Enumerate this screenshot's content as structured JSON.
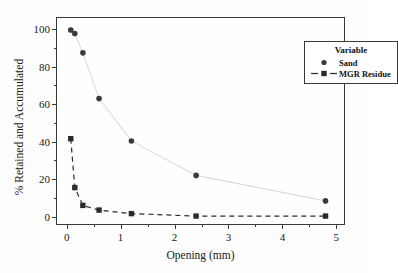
{
  "chart_data": {
    "type": "scatter",
    "title": "",
    "xlabel": "Opening (mm)",
    "ylabel": "% Retained and Accumulated",
    "xlim": [
      -0.18,
      5.18
    ],
    "ylim": [
      -5,
      106
    ],
    "xticks": [
      0,
      1,
      2,
      3,
      4,
      5
    ],
    "xtick_labels": [
      "0",
      "1",
      "2",
      "3",
      "4",
      "5"
    ],
    "yticks": [
      0,
      20,
      40,
      60,
      80,
      100
    ],
    "ytick_labels": [
      "0",
      "20",
      "40",
      "60",
      "80",
      "100"
    ],
    "grid": false,
    "legend": {
      "title": "Variable",
      "position": "top-right",
      "entries": [
        {
          "label": "Sand",
          "marker": "circle",
          "line": "none",
          "color": "#3a3a3a"
        },
        {
          "label": "MGR Residue",
          "marker": "square",
          "line": "dashed",
          "color": "#2b2b2b"
        }
      ]
    },
    "series": [
      {
        "name": "Sand",
        "marker": "circle",
        "line_style": "solid-light",
        "color": "#3a3a3a",
        "x": [
          0.075,
          0.15,
          0.3,
          0.6,
          1.2,
          2.4,
          4.8
        ],
        "y": [
          99.6,
          97.7,
          87.4,
          63.0,
          40.4,
          22.0,
          8.4
        ]
      },
      {
        "name": "MGR Residue",
        "marker": "square",
        "line_style": "dashed",
        "color": "#2b2b2b",
        "x": [
          0.075,
          0.15,
          0.3,
          0.6,
          1.2,
          2.4,
          4.8
        ],
        "y": [
          41.6,
          15.5,
          6.0,
          3.5,
          1.6,
          0.3,
          0.3
        ]
      }
    ]
  }
}
